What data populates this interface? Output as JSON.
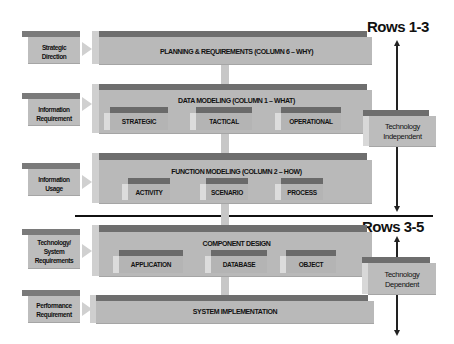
{
  "headers": {
    "rows_top": "Rows 1-3",
    "rows_bottom": "Rows 3-5"
  },
  "left_inputs": [
    {
      "label_lines": [
        "Strategic",
        "Direction"
      ]
    },
    {
      "label_lines": [
        "Information",
        "Requirement"
      ]
    },
    {
      "label_lines": [
        "Information",
        "Usage"
      ]
    },
    {
      "label_lines": [
        "Technology/",
        "System",
        "Requirements"
      ]
    },
    {
      "label_lines": [
        "Performance",
        "Requirement"
      ]
    }
  ],
  "layers": [
    {
      "title": "PLANNING & REQUIREMENTS (COLUMN 6 – WHY)",
      "items": []
    },
    {
      "title": "DATA MODELING (COLUMN 1 – WHAT)",
      "items": [
        "STRATEGIC",
        "TACTICAL",
        "OPERATIONAL"
      ]
    },
    {
      "title": "FUNCTION MODELING (COLUMN 2 – HOW)",
      "items": [
        "ACTIVITY",
        "SCENARIO",
        "PROCESS"
      ]
    },
    {
      "title": "COMPONENT DESIGN",
      "items": [
        "APPLICATION",
        "DATABASE",
        "OBJECT"
      ]
    },
    {
      "title": "SYSTEM IMPLEMENTATION",
      "items": []
    }
  ],
  "right_labels": [
    {
      "label_lines": [
        "Technology",
        "Independent"
      ]
    },
    {
      "label_lines": [
        "Technology",
        "Dependent"
      ]
    }
  ],
  "colors": {
    "box_top": "#6e6e6e",
    "box_front": "#b9b9b9",
    "line": "#111111"
  }
}
